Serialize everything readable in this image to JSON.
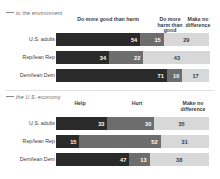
{
  "top_cropped_line": "·  ·   ·    ·",
  "panels": [
    {
      "id": "environment",
      "subtitle": "to the environment",
      "headers": [
        {
          "label": "Do more good than harm",
          "left": 60,
          "width": 96
        },
        {
          "label": "Do more harm than good",
          "left": 155,
          "width": 30
        },
        {
          "label": "Make no difference",
          "left": 182,
          "width": 32
        }
      ],
      "rows": [
        {
          "label": "U.S. adults",
          "values": [
            54,
            15,
            29
          ]
        },
        {
          "label": "Rep/lean Rep",
          "values": [
            34,
            22,
            43
          ]
        },
        {
          "label": "Dem/lean Dem",
          "values": [
            71,
            10,
            17
          ]
        }
      ]
    },
    {
      "id": "economy",
      "subtitle": "the U.S. economy",
      "headers": [
        {
          "label": "Help",
          "left": 60,
          "width": 40
        },
        {
          "label": "Hurt",
          "left": 122,
          "width": 30
        },
        {
          "label": "Make no difference",
          "left": 176,
          "width": 34
        }
      ],
      "rows": [
        {
          "label": "U.S. adults",
          "values": [
            33,
            30,
            35
          ]
        },
        {
          "label": "Rep/lean Rep",
          "values": [
            15,
            52,
            31
          ]
        },
        {
          "label": "Dem/lean Dem",
          "values": [
            47,
            13,
            38
          ]
        }
      ]
    }
  ],
  "chart_data": {
    "type": "bar",
    "title": "",
    "subtitle": "",
    "orientation": "horizontal",
    "stacked": true,
    "xlabel": "",
    "ylabel": "",
    "xlim": [
      0,
      100
    ],
    "grid": false,
    "legend_position": "top",
    "panels": [
      {
        "name": "to the environment",
        "categories": [
          "U.S. adults",
          "Rep/lean Rep",
          "Dem/lean Dem"
        ],
        "series": [
          {
            "name": "Do more good than harm",
            "values": [
              54,
              34,
              71
            ],
            "color": "#2a2a2a"
          },
          {
            "name": "Do more harm than good",
            "values": [
              15,
              22,
              10
            ],
            "color": "#6d6d6d"
          },
          {
            "name": "Make no difference",
            "values": [
              29,
              43,
              17
            ],
            "color": "#d8d8d8"
          }
        ]
      },
      {
        "name": "the U.S. economy",
        "categories": [
          "U.S. adults",
          "Rep/lean Rep",
          "Dem/lean Dem"
        ],
        "series": [
          {
            "name": "Help",
            "values": [
              33,
              15,
              47
            ],
            "color": "#2a2a2a"
          },
          {
            "name": "Hurt",
            "values": [
              30,
              52,
              13
            ],
            "color": "#6d6d6d"
          },
          {
            "name": "Make no difference",
            "values": [
              35,
              31,
              38
            ],
            "color": "#d8d8d8"
          }
        ]
      }
    ]
  }
}
